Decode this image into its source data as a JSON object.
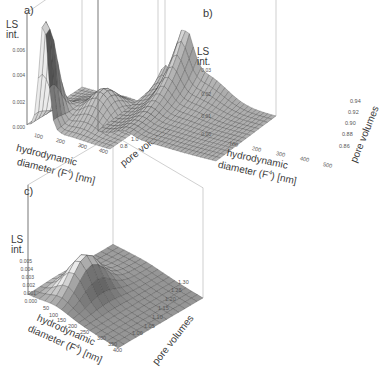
{
  "chart_data": [
    {
      "panel": "a)",
      "type": "surface3d",
      "zlabel": "LS int.",
      "xlabel": "hydrodynamic diameter (F4) [nm]",
      "ylabel": "pore volumes",
      "z_ticks": [
        "0.000",
        "0.002",
        "0.004",
        "0.006"
      ],
      "x_ticks": [
        "100",
        "200",
        "300",
        "400"
      ],
      "y_ticks": [
        "0.8",
        "1.0",
        "1.2",
        "1.4",
        "1.6"
      ],
      "zlim": [
        0,
        0.008
      ],
      "xlim": [
        50,
        450
      ],
      "ylim": [
        0.7,
        1.6
      ],
      "description": "Sharp peak ~0.008 at ~150 nm near early pore volumes, broad secondary hump ~0.002 at ~250-300 nm across later pore volumes"
    },
    {
      "panel": "b)",
      "type": "surface3d",
      "zlabel": "LS int.",
      "xlabel": "hydrodynamic diameter (F4) [nm]",
      "ylabel": "pore volumes",
      "z_ticks": [
        "0.00",
        "0.01",
        "0.02",
        "0.03"
      ],
      "x_ticks": [
        "100",
        "200",
        "300",
        "400",
        "500"
      ],
      "y_ticks": [
        "0.86",
        "0.88",
        "0.90",
        "0.92",
        "0.94"
      ],
      "zlim": [
        0,
        0.035
      ],
      "xlim": [
        50,
        500
      ],
      "ylim": [
        0.85,
        0.95
      ],
      "description": "Ridge growing with pore volume; tall narrow peak ~0.035 at ~150 nm at last pore volume, decaying tail toward 500 nm"
    },
    {
      "panel": "c)",
      "type": "surface3d",
      "zlabel": "LS int.",
      "xlabel": "hydrodynamic diameter (F4) [nm]",
      "ylabel": "pore volumes",
      "z_ticks": [
        "0.000",
        "0.001",
        "0.002",
        "0.003",
        "0.004",
        "0.005"
      ],
      "x_ticks": [
        "50",
        "100",
        "150",
        "200",
        "250",
        "300",
        "350",
        "400"
      ],
      "y_ticks": [
        "1.00",
        "1.05",
        "1.10",
        "1.15",
        "1.20",
        "1.25",
        "1.30"
      ],
      "zlim": [
        0,
        0.006
      ],
      "xlim": [
        50,
        400
      ],
      "ylim": [
        1.0,
        1.3
      ],
      "description": "Single smooth hump ~0.006 at ~150 nm centered near 1.10-1.15 pore volumes, flat near zero elsewhere"
    }
  ],
  "panels": {
    "a": {
      "letter": "a)",
      "zlabel_1": "LS",
      "zlabel_2": "int.",
      "z_ticks": [
        "0.006",
        "0.004",
        "0.002",
        "0.000"
      ],
      "x_ticks": [
        "100",
        "200",
        "300",
        "400"
      ],
      "y_ticks": [
        "0.8",
        "1.0",
        "1.2",
        "1.4",
        "1.6"
      ],
      "xlabel_1": "hydrodynamic",
      "xlabel_2": "diameter (F",
      "xlabel_sup": "4",
      "xlabel_3": ") [nm]",
      "ylabel": "pore volumes"
    },
    "b": {
      "letter": "b)",
      "zlabel_1": "LS",
      "zlabel_2": "int.",
      "z_ticks": [
        "0.03",
        "0.02",
        "0.01",
        "0.00"
      ],
      "x_ticks": [
        "100",
        "200",
        "300",
        "400",
        "500"
      ],
      "y_ticks": [
        "0.94",
        "0.92",
        "0.90",
        "0.88",
        "0.86"
      ],
      "xlabel_1": "hydrodynamic",
      "xlabel_2": "diameter (F",
      "xlabel_sup": "4",
      "xlabel_3": ") [nm]",
      "ylabel": "pore volumes"
    },
    "c": {
      "letter": "c)",
      "zlabel_1": "LS",
      "zlabel_2": "int.",
      "z_ticks": [
        "0.005",
        "0.004",
        "0.003",
        "0.002",
        "0.001",
        "0.000"
      ],
      "x_ticks": [
        "50",
        "100",
        "150",
        "200",
        "250",
        "300",
        "350",
        "400"
      ],
      "y_ticks": [
        "1.30",
        "1.25",
        "1.20",
        "1.15",
        "1.10",
        "1.05",
        "1.00"
      ],
      "xlabel_1": "hydrodynamic",
      "xlabel_2": "diameter (F",
      "xlabel_sup": "4",
      "xlabel_3": ")  [nm]",
      "ylabel": "pore volumes"
    }
  },
  "colors": {
    "surface_light": "#e2e2e2",
    "surface_mid": "#a8a8a8",
    "surface_dark": "#6e6e6e",
    "mesh_line": "#2e2e2e",
    "box_line": "#b0b0b0",
    "text": "#3a3a3a"
  }
}
